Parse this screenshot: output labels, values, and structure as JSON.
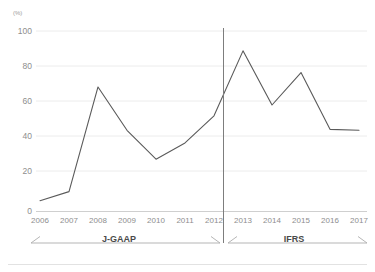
{
  "chart_data": {
    "type": "line",
    "title": "",
    "subtitle": "",
    "xlabel": "",
    "ylabel": "",
    "unit_label": "(%)",
    "categories": [
      "2006",
      "2007",
      "2008",
      "2009",
      "2010",
      "2011",
      "2012",
      "2013",
      "2014",
      "2015",
      "2016",
      "2017"
    ],
    "values": [
      6,
      11,
      69,
      45,
      29,
      38,
      53,
      89,
      59,
      77,
      45.5,
      45
    ],
    "series": [
      {
        "name": "value",
        "values": [
          6,
          11,
          69,
          45,
          29,
          38,
          53,
          89,
          59,
          77,
          45.5,
          45
        ]
      }
    ],
    "ylim": [
      0,
      100
    ],
    "yticks": [
      "0",
      "20",
      "40",
      "60",
      "80",
      "100"
    ],
    "grid": true,
    "grid_axis": "y",
    "legend": "none",
    "line_color": "#5a5a5a",
    "grid_color": "#ececec",
    "axis_color": "#cfcfcf",
    "annotations": [
      {
        "name": "accounting-standard-divider",
        "type": "vertical-line",
        "x_position": "between 2012 and 2013",
        "color": "#7d7d7d"
      },
      {
        "name": "period-bracket-left",
        "type": "double-arrow-bracket",
        "label": "J-GAAP",
        "from": "2006",
        "to": "2012"
      },
      {
        "name": "period-bracket-right",
        "type": "double-arrow-bracket",
        "label": "IFRS",
        "from": "2013",
        "to": "2017"
      }
    ]
  },
  "periods": {
    "left_label": "J-GAAP",
    "right_label": "IFRS"
  }
}
